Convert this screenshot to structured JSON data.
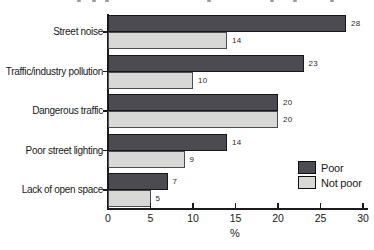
{
  "chart_data": {
    "type": "bar",
    "orientation": "horizontal",
    "categories": [
      "Street noise",
      "Traffic/industry pollution",
      "Dangerous traffic",
      "Poor street lighting",
      "Lack of open space"
    ],
    "series": [
      {
        "name": "Poor",
        "values": [
          28,
          23,
          20,
          14,
          7
        ],
        "fill": "#4b4b51",
        "border": "#17171a"
      },
      {
        "name": "Not poor",
        "values": [
          14,
          10,
          20,
          9,
          5
        ],
        "fill": "#d8d8d6",
        "border": "#4b4b51"
      }
    ],
    "value_labels": true,
    "xlabel": "%",
    "xlim": [
      0,
      30
    ],
    "xticks": [
      0,
      5,
      10,
      15,
      20,
      25,
      30
    ],
    "grid": false,
    "legend_position": "right-lower"
  },
  "colors": {
    "background": "#ffffff",
    "axis": "#1b1b1d",
    "text": "#1a1a1a"
  }
}
